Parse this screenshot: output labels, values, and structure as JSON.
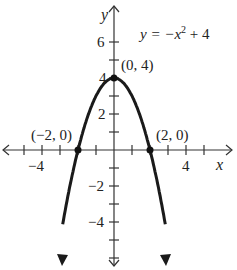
{
  "chart_data": {
    "type": "line",
    "equation_parts": {
      "lhs": "y = −x",
      "exp": "2",
      "rhs": " + 4"
    },
    "xlabel": "x",
    "ylabel": "y",
    "xlim": [
      -6.3,
      6.6
    ],
    "ylim": [
      -6.3,
      8.3
    ],
    "grid": false,
    "x_ticks": [
      -5,
      -4,
      -3,
      -2,
      -1,
      1,
      2,
      3,
      4,
      5
    ],
    "y_ticks": [
      -6,
      -5,
      -4,
      -3,
      -2,
      -1,
      1,
      2,
      3,
      4,
      5,
      6
    ],
    "x_tick_labels": [
      {
        "value": -4,
        "text": "−4"
      },
      {
        "value": 4,
        "text": "4"
      }
    ],
    "y_tick_labels": [
      {
        "value": 6,
        "text": "6"
      },
      {
        "value": 4,
        "text": "4"
      },
      {
        "value": 2,
        "text": "2"
      },
      {
        "value": -2,
        "text": "−2"
      },
      {
        "value": -4,
        "text": "−4"
      }
    ],
    "series": [
      {
        "name": "y = -x^2 + 4",
        "x_range": [
          -2.85,
          2.85
        ],
        "function": "-x^2+4",
        "color": "#1a1a1a"
      }
    ],
    "points": [
      {
        "x": -2,
        "y": 0,
        "label": "(−2, 0)"
      },
      {
        "x": 0,
        "y": 4,
        "label": "(0, 4)"
      },
      {
        "x": 2,
        "y": 0,
        "label": "(2, 0)"
      }
    ]
  },
  "labels": {
    "y_axis": "y",
    "x_axis": "x",
    "eq_lhs": "y = −x",
    "eq_exp": "2",
    "eq_rhs": " + 4",
    "tick_y6": "6",
    "tick_y4": "4",
    "tick_y2": "2",
    "tick_yn2": "−2",
    "tick_yn4": "−4",
    "tick_xn4": "−4",
    "tick_x4": "4",
    "pt_vertex": "(0, 4)",
    "pt_left": "(−2, 0)",
    "pt_right": "(2, 0)"
  }
}
